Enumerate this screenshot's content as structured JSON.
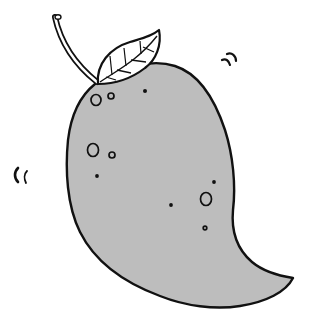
{
  "illustration": {
    "subject": "mango",
    "style": "cartoon line art",
    "colors": {
      "background": "#ffffff",
      "fruit_fill": "#bdbdbd",
      "leaf_fill": "#ffffff",
      "stem_fill": "#ffffff",
      "outline": "#111111"
    },
    "elements": {
      "stem": "stem",
      "leaf": "leaf",
      "body": "mango-body",
      "spots": "speckles",
      "motion_marks_right": "wiggle-marks-right",
      "motion_marks_left": "wiggle-marks-left"
    }
  }
}
